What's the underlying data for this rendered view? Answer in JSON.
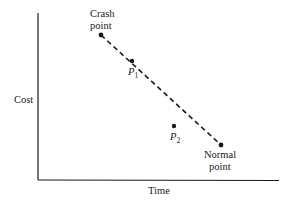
{
  "diagram": {
    "x_axis_label": "Time",
    "y_axis_label": "Cost",
    "points": [
      {
        "id": "crash",
        "label_lines": [
          "Crash",
          "point"
        ]
      },
      {
        "id": "normal",
        "label_lines": [
          "Normal",
          "point"
        ]
      },
      {
        "id": "p1",
        "label": "P",
        "subscript": "1"
      },
      {
        "id": "p2",
        "label": "P",
        "subscript": "2"
      }
    ],
    "connector": {
      "from": "crash",
      "to": "normal",
      "style": "dashed"
    },
    "colors": {
      "ink": "#1a1a1a",
      "background": "#ffffff"
    }
  }
}
